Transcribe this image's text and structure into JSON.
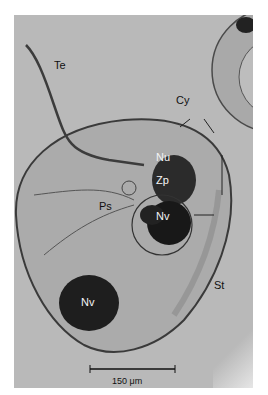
{
  "figure": {
    "labels": {
      "te": "Te",
      "cy": "Cy",
      "nu": "Nu",
      "zp": "Zp",
      "ps": "Ps",
      "nv_upper": "Nv",
      "nv_lower": "Nv",
      "st": "St"
    },
    "scale_bar": {
      "label": "150 μm",
      "value": 150,
      "unit": "μm"
    },
    "colors": {
      "background": "#b9b9b9",
      "dark_body": "#1e1e1e",
      "outline": "#3a3a3a"
    }
  }
}
